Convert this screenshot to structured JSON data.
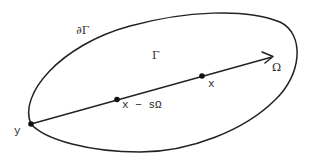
{
  "diagram": {
    "type": "geometric-domain",
    "stroke_color": "#222222",
    "labels": {
      "boundary": "∂Γ",
      "domain": "Γ",
      "direction": "Ω",
      "point_x": "x",
      "point_shifted": "x − sΩ",
      "point_y": "y"
    },
    "elements": {
      "domain_region": {
        "shape": "tilted-ellipse",
        "label": "Γ"
      },
      "boundary_curve": {
        "label": "∂Γ"
      },
      "ray": {
        "from": "y",
        "through": [
          "x − sΩ",
          "x"
        ],
        "direction": "Ω",
        "arrowhead": true
      },
      "points": [
        {
          "name": "y",
          "on": "boundary"
        },
        {
          "name": "x − sΩ",
          "on": "ray"
        },
        {
          "name": "x",
          "on": "ray"
        }
      ]
    }
  }
}
